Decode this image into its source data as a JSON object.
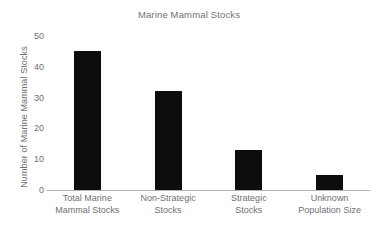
{
  "chart_data": {
    "type": "bar",
    "title": "Marine Mammal Stocks",
    "xlabel": "",
    "ylabel": "Number of Marine Mammal Stocks",
    "categories": [
      "Total Marine Mammal Stocks",
      "Non-Strategic Stocks",
      "Strategic Stocks",
      "Unknown Population Size"
    ],
    "category_lines": [
      [
        "Total Marine",
        "Mammal Stocks"
      ],
      [
        "Non-Strategic",
        "Stocks"
      ],
      [
        "Strategic",
        "Stocks"
      ],
      [
        "Unknown",
        "Population Size"
      ]
    ],
    "values": [
      45,
      32,
      13,
      5
    ],
    "ylim": [
      0,
      50
    ],
    "yticks": [
      0,
      10,
      20,
      30,
      40,
      50
    ],
    "ytick_labels": [
      "0",
      "10",
      "20",
      "30",
      "40",
      "50"
    ],
    "grid": false,
    "legend": false,
    "bar_color": "#0d0d0d",
    "axis_color": "#b2b2b2",
    "text_color": "#6f6f6f",
    "background": "#ffffff"
  }
}
